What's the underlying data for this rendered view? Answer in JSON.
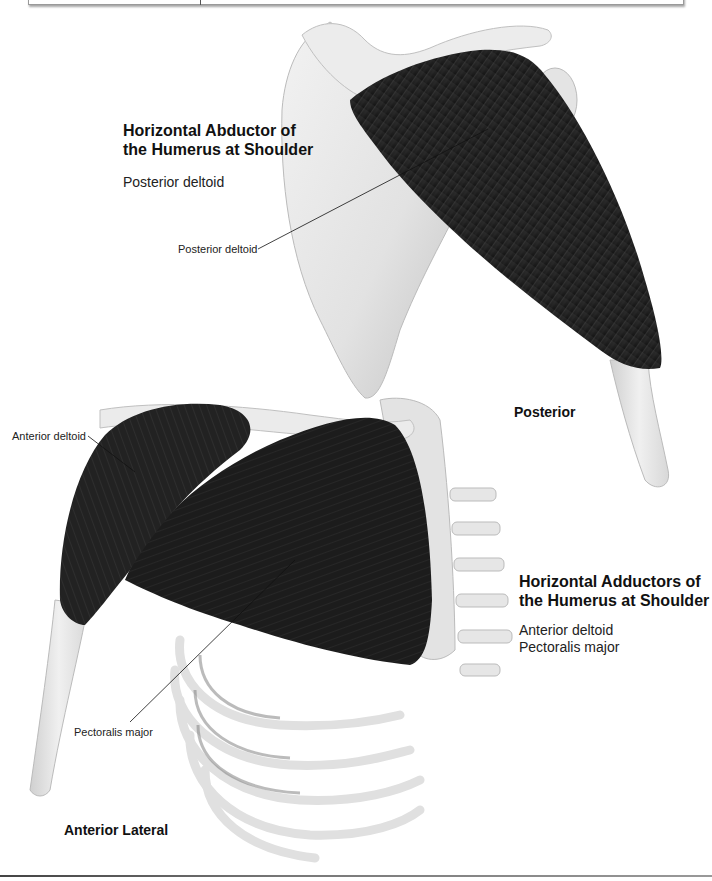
{
  "header": {
    "box_visible": true
  },
  "posterior_section": {
    "heading_line1": "Horizontal Abductor of",
    "heading_line2": "the Humerus at Shoulder",
    "muscles": [
      "Posterior deltoid"
    ],
    "view_label": "Posterior",
    "callouts": [
      {
        "label": "Posterior deltoid"
      }
    ]
  },
  "anterior_section": {
    "heading_line1": "Horizontal Adductors of",
    "heading_line2": "the Humerus at Shoulder",
    "muscles": [
      "Anterior deltoid",
      "Pectoralis major"
    ],
    "view_label": "Anterior Lateral",
    "callouts": [
      {
        "label": "Anterior deltoid"
      },
      {
        "label": "Pectoralis major"
      }
    ]
  },
  "colors": {
    "muscle": "#1e1e1e",
    "muscle_fiber": "#5a5a5a",
    "bone": "#e6e6e6",
    "bone_shadow": "#b8b8b8",
    "text": "#111111"
  }
}
